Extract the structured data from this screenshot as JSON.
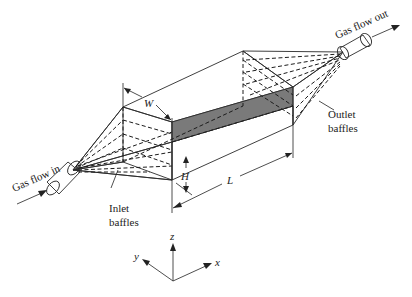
{
  "figure": {
    "labels": {
      "gas_in": "Gas flow in",
      "gas_out": "Gas flow out",
      "inlet_line1": "Inlet",
      "inlet_line2": "baffles",
      "outlet_line1": "Outlet",
      "outlet_line2": "baffles",
      "width": "W",
      "height": "H",
      "length": "L"
    },
    "axes": {
      "x": "x",
      "y": "y",
      "z": "z"
    },
    "colors": {
      "top_face": "#8a8a8a",
      "front_face": "#6e6e6e",
      "end_face": "#9a9a9a",
      "cone_upper": "#7c7c7c",
      "cone_lower": "#5e5e5e",
      "pipe": "#d8d8d8"
    }
  }
}
